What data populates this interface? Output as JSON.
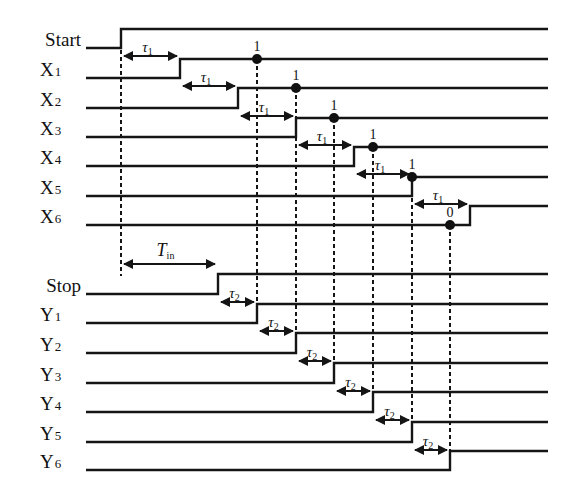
{
  "line_end_x": 548,
  "line_start_x": 86,
  "start_group": {
    "signals": [
      {
        "name": "Start",
        "base": "Start",
        "sub": "",
        "low_y": 48,
        "high_y": 29,
        "rise_x": 121
      },
      {
        "name": "X1",
        "base": "X",
        "sub": "1",
        "low_y": 78,
        "high_y": 59,
        "rise_x": 180
      },
      {
        "name": "X2",
        "base": "X",
        "sub": "2",
        "low_y": 108,
        "high_y": 88,
        "rise_x": 238
      },
      {
        "name": "X3",
        "base": "X",
        "sub": "3",
        "low_y": 137,
        "high_y": 118,
        "rise_x": 296
      },
      {
        "name": "X4",
        "base": "X",
        "sub": "4",
        "low_y": 166,
        "high_y": 147,
        "rise_x": 354
      },
      {
        "name": "X5",
        "base": "X",
        "sub": "5",
        "low_y": 196,
        "high_y": 177,
        "rise_x": 412
      },
      {
        "name": "X6",
        "base": "X",
        "sub": "6",
        "low_y": 225,
        "high_y": 206,
        "rise_x": 470
      }
    ],
    "delay_label": "τ",
    "delay_sub": "1"
  },
  "stop_group": {
    "signals": [
      {
        "name": "Stop",
        "base": "Stop",
        "sub": "",
        "low_y": 294,
        "high_y": 274,
        "rise_x": 218
      },
      {
        "name": "Y1",
        "base": "Y",
        "sub": "1",
        "low_y": 323,
        "high_y": 304,
        "rise_x": 257
      },
      {
        "name": "Y2",
        "base": "Y",
        "sub": "2",
        "low_y": 353,
        "high_y": 333,
        "rise_x": 296
      },
      {
        "name": "Y3",
        "base": "Y",
        "sub": "3",
        "low_y": 383,
        "high_y": 363,
        "rise_x": 334
      },
      {
        "name": "Y4",
        "base": "Y",
        "sub": "4",
        "low_y": 412,
        "high_y": 392,
        "rise_x": 373
      },
      {
        "name": "Y5",
        "base": "Y",
        "sub": "5",
        "low_y": 442,
        "high_y": 422,
        "rise_x": 412
      },
      {
        "name": "Y6",
        "base": "Y",
        "sub": "6",
        "low_y": 470,
        "high_y": 451,
        "rise_x": 450
      }
    ],
    "delay_label": "τ",
    "delay_sub": "2"
  },
  "samples": [
    {
      "signal": "X1",
      "x": 257,
      "y": 59,
      "value": "1"
    },
    {
      "signal": "X2",
      "x": 296,
      "y": 88,
      "value": "1"
    },
    {
      "signal": "X3",
      "x": 334,
      "y": 118,
      "value": "1"
    },
    {
      "signal": "X4",
      "x": 373,
      "y": 147,
      "value": "1"
    },
    {
      "signal": "X5",
      "x": 412,
      "y": 177,
      "value": "1"
    },
    {
      "signal": "X6",
      "x": 450,
      "y": 225,
      "value": "0"
    }
  ],
  "interval": {
    "label": "T",
    "sub": "in",
    "from_x": 121,
    "to_x": 218,
    "y": 264
  },
  "thermometer_code": "111110"
}
